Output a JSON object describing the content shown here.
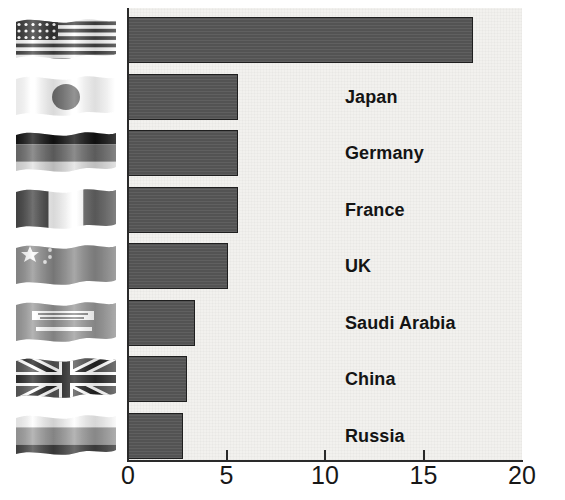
{
  "chart_data": {
    "type": "bar",
    "orientation": "horizontal",
    "title": "",
    "subtitle": "",
    "xlabel": "",
    "ylabel": "",
    "xlim": [
      0,
      20
    ],
    "xticks": [
      0,
      5,
      10,
      15,
      20
    ],
    "xtick_labels": [
      "0",
      "5",
      "10",
      "15",
      "20"
    ],
    "grid": false,
    "legend": null,
    "categories": [
      "US",
      "Japan",
      "Germany",
      "France",
      "UK",
      "Saudi Arabia",
      "China",
      "Russia"
    ],
    "values": [
      17.5,
      5.6,
      5.6,
      5.6,
      5.1,
      3.4,
      3.0,
      2.8
    ],
    "bar_color": "#575757",
    "bar_border_color": "#1f1f1f",
    "plot_background": "#f2f1ee",
    "label_color": "#141414",
    "label_on_bar_color": "#ffffff",
    "bars": [
      {
        "label": "US",
        "value": 17.5,
        "label_on_bar": true,
        "flag": "flag-us"
      },
      {
        "label": "Japan",
        "value": 5.6,
        "label_on_bar": false,
        "flag": "flag-japan"
      },
      {
        "label": "Germany",
        "value": 5.6,
        "label_on_bar": false,
        "flag": "flag-germany"
      },
      {
        "label": "France",
        "value": 5.6,
        "label_on_bar": false,
        "flag": "flag-france"
      },
      {
        "label": "UK",
        "value": 5.1,
        "label_on_bar": false,
        "flag": "flag-china"
      },
      {
        "label": "Saudi Arabia",
        "value": 3.4,
        "label_on_bar": false,
        "flag": "flag-saudi-arabia"
      },
      {
        "label": "China",
        "value": 3.0,
        "label_on_bar": false,
        "flag": "flag-uk"
      },
      {
        "label": "Russia",
        "value": 2.8,
        "label_on_bar": false,
        "flag": "flag-russia"
      }
    ]
  }
}
